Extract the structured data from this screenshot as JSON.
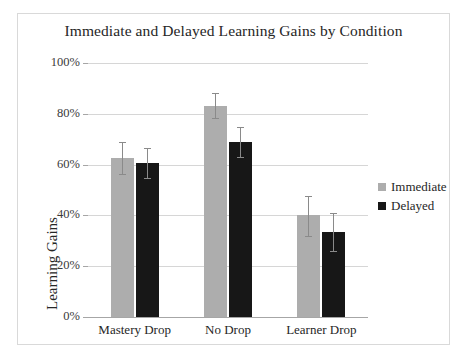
{
  "chart_data": {
    "type": "bar",
    "title": "Immediate and Delayed Learning Gains by Condition",
    "xlabel": "",
    "ylabel": "Learning Gains",
    "categories": [
      "Mastery Drop",
      "No Drop",
      "Learner Drop"
    ],
    "ylim": [
      0,
      100
    ],
    "y_ticks": [
      0,
      20,
      40,
      60,
      80,
      100
    ],
    "y_tick_labels": [
      "0%",
      "20%",
      "40%",
      "60%",
      "80%",
      "100%"
    ],
    "y_unit": "%",
    "grid": true,
    "legend_position": "right",
    "series": [
      {
        "name": "Immediate",
        "color": "#adadad",
        "values": [
          62.5,
          83.0,
          40.0
        ],
        "error_low": [
          56.0,
          78.0,
          31.5
        ],
        "error_high": [
          69.0,
          88.0,
          47.5
        ]
      },
      {
        "name": "Delayed",
        "color": "#171717",
        "values": [
          60.8,
          69.0,
          33.5
        ],
        "error_low": [
          54.5,
          62.5,
          25.5
        ],
        "error_high": [
          66.5,
          75.0,
          41.0
        ]
      }
    ]
  },
  "legend": {
    "items": [
      {
        "label": "Immediate",
        "swatch": "immediate"
      },
      {
        "label": "Delayed",
        "swatch": "delayed"
      }
    ]
  },
  "colors": {
    "immediate": "#adadad",
    "delayed": "#171717",
    "gridline": "#d6d6d6",
    "axis": "#a6a6a6",
    "error": "#8a8a8a",
    "border": "#d9d9d9",
    "background": "#ffffff",
    "text": "#262626"
  }
}
